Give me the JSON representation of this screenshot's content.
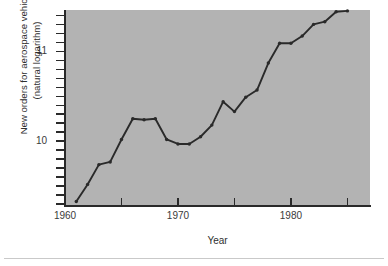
{
  "figure": {
    "background_color": "#ffffff",
    "plot_background_color": "#b3b3b3",
    "line_color": "#2a2a2a",
    "axis_color": "#2a2a2a",
    "title_sliver": ""
  },
  "chart_data": {
    "type": "line",
    "title": "",
    "xlabel": "Year",
    "ylabel": "New orders for aerospace vehicles\n(natural logarithm)",
    "ylabel_line1": "New orders for aerospace vehicles",
    "ylabel_line2": "(natural logarithm)",
    "x_tick_labels": [
      "1960",
      "1970",
      "1980"
    ],
    "x_tick_values": [
      1960,
      1970,
      1980
    ],
    "x_minor_ticks": [
      1965,
      1975,
      1985
    ],
    "y_tick_labels": [
      "10",
      "11"
    ],
    "y_tick_values": [
      10,
      11
    ],
    "xlim": [
      1960,
      1987
    ],
    "ylim": [
      9.28,
      11.46
    ],
    "grid": false,
    "legend": false,
    "markers": true,
    "x": [
      1961,
      1962,
      1963,
      1964,
      1965,
      1966,
      1967,
      1968,
      1969,
      1970,
      1971,
      1972,
      1973,
      1974,
      1975,
      1976,
      1977,
      1978,
      1979,
      1980,
      1981,
      1982,
      1983,
      1984,
      1985
    ],
    "values": [
      9.33,
      9.52,
      9.74,
      9.77,
      10.02,
      10.25,
      10.24,
      10.25,
      10.02,
      9.97,
      9.97,
      10.05,
      10.18,
      10.44,
      10.33,
      10.49,
      10.57,
      10.87,
      11.09,
      11.09,
      11.17,
      11.3,
      11.33,
      11.44,
      11.45
    ],
    "series": [
      {
        "name": "New orders for aerospace vehicles",
        "values": [
          9.33,
          9.52,
          9.74,
          9.77,
          10.02,
          10.25,
          10.24,
          10.25,
          10.02,
          9.97,
          9.97,
          10.05,
          10.18,
          10.44,
          10.33,
          10.49,
          10.57,
          10.87,
          11.09,
          11.09,
          11.17,
          11.3,
          11.33,
          11.44,
          11.45
        ]
      }
    ]
  }
}
